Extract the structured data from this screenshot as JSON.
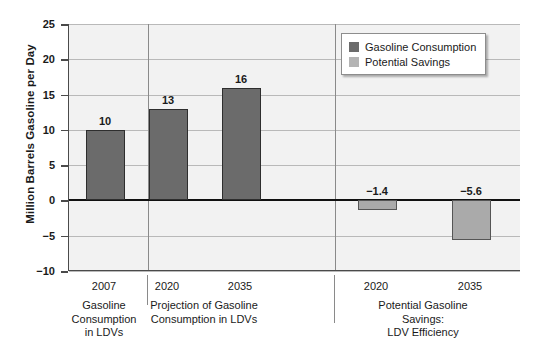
{
  "chart_data": {
    "type": "bar",
    "title": "",
    "xlabel": "",
    "ylabel": "Million Barrels Gasoline per Day",
    "ylim": [
      -10,
      25
    ],
    "ytick_labels": [
      "25",
      "20",
      "15",
      "10",
      "5",
      "0",
      "−5",
      "−10"
    ],
    "ytick_values": [
      25,
      20,
      15,
      10,
      5,
      0,
      -5,
      -10
    ],
    "grid": true,
    "legend_position": "top-right",
    "categories": [
      "2007",
      "2020",
      "2035",
      "2020",
      "2035"
    ],
    "values": [
      10,
      13,
      16,
      -1.4,
      -5.6
    ],
    "value_labels": [
      "10",
      "13",
      "16",
      "−1.4",
      "−5.6"
    ],
    "series": [
      {
        "name": "Gasoline Consumption",
        "color": "#6b6b6b",
        "values": [
          10,
          13,
          16,
          null,
          null
        ]
      },
      {
        "name": "Potential Savings",
        "color": "#b4b4b4",
        "values": [
          null,
          null,
          null,
          -1.4,
          -5.6
        ]
      }
    ],
    "groups": [
      {
        "label": "Gasoline\nConsumption\nin LDVs",
        "categories": [
          "2007"
        ]
      },
      {
        "label": "Projection of Gasoline\nConsumption in LDVs",
        "categories": [
          "2020",
          "2035"
        ]
      },
      {
        "label": "Potential Gasoline Savings:\nLDV Efficiency",
        "categories": [
          "2020",
          "2035"
        ]
      }
    ]
  },
  "legend": {
    "items": [
      {
        "label": "Gasoline Consumption",
        "color": "#6b6b6b"
      },
      {
        "label": "Potential Savings",
        "color": "#b4b4b4"
      }
    ]
  },
  "axis": {
    "y_title": "Million Barrels Gasoline per Day",
    "ticks": [
      "25",
      "20",
      "15",
      "10",
      "5",
      "0",
      "−5",
      "−10"
    ]
  },
  "bars": [
    {
      "name": "bar-2007-consumption",
      "category": "2007",
      "value_label": "10"
    },
    {
      "name": "bar-2020-consumption",
      "category": "2020",
      "value_label": "13"
    },
    {
      "name": "bar-2035-consumption",
      "category": "2035",
      "value_label": "16"
    },
    {
      "name": "bar-2020-savings",
      "category": "2020",
      "value_label": "−1.4"
    },
    {
      "name": "bar-2035-savings",
      "category": "2035",
      "value_label": "−5.6"
    }
  ],
  "category_labels": [
    "2007",
    "2020",
    "2035",
    "2020",
    "2035"
  ],
  "group_labels": [
    "Gasoline\nConsumption\nin LDVs",
    "Projection of Gasoline\nConsumption in LDVs",
    "Potential Gasoline Savings:\nLDV Efficiency"
  ]
}
